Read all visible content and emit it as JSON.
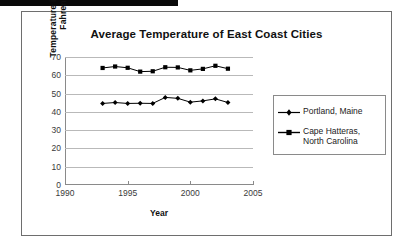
{
  "chart_data": {
    "type": "line",
    "title": "Average Temperature of East Coast Cities",
    "xlabel": "Year",
    "ylabel": "Temperature in Degrees Fahrenheit",
    "ylabel_line1": "Temperature in Degrees",
    "ylabel_line2": "Fahrenheit",
    "x": [
      1993,
      1994,
      1995,
      1996,
      1997,
      1998,
      1999,
      2000,
      2001,
      2002,
      2003
    ],
    "xlim": [
      1990,
      2005
    ],
    "ylim": [
      0,
      70
    ],
    "xticks": [
      1990,
      1995,
      2000,
      2005
    ],
    "yticks": [
      0,
      10,
      20,
      30,
      40,
      50,
      60,
      70
    ],
    "grid": true,
    "legend_position": "right",
    "series": [
      {
        "name": "Portland, Maine",
        "marker": "diamond",
        "color": "#000000",
        "values": [
          44.6,
          45.1,
          44.6,
          44.7,
          44.6,
          47.9,
          47.4,
          45.3,
          46.0,
          47.1,
          45.1
        ]
      },
      {
        "name": "Cape Hatteras, North Carolina",
        "marker": "square",
        "color": "#000000",
        "values": [
          64.0,
          64.8,
          64.1,
          62.0,
          62.2,
          64.4,
          64.3,
          62.7,
          63.5,
          65.2,
          63.6
        ]
      }
    ]
  },
  "legend": {
    "items": [
      {
        "label": "Portland, Maine",
        "marker": "diamond"
      },
      {
        "label": "Cape Hatteras, North Carolina",
        "marker": "square"
      }
    ]
  }
}
